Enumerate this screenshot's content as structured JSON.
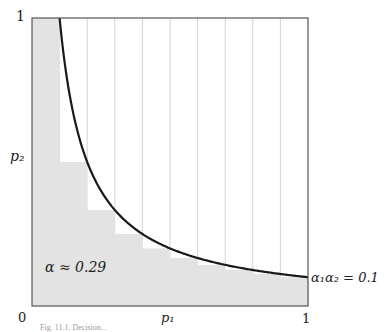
{
  "figure": {
    "annotation_alpha": "α ≈ 0.29",
    "curve_label": "α₁α₂ = 0.1",
    "x_axis_label": "p₁",
    "y_axis_label": "p₂",
    "tick_x0": "0",
    "tick_x1": "1",
    "tick_y1": "1",
    "caption": "Fig. 11.1. Decision..."
  },
  "colors": {
    "shade": "#e3e3e3",
    "frame": "#555555",
    "grid": "#c8c8c8",
    "curve": "#1a1a1a"
  },
  "chart_data": {
    "type": "area",
    "title": "",
    "xlabel": "p1",
    "ylabel": "p2",
    "xlim": [
      0,
      1
    ],
    "ylim": [
      0,
      1
    ],
    "grid": "vertical lines at every 0.1",
    "curve": {
      "equation": "p1 * p2 = 0.1",
      "label": "α1α2 = 0.1"
    },
    "shaded_region": {
      "description": "staircase below curve, plus column p1 in [0,0.1] shaded full height",
      "x_edges": [
        0.0,
        0.1,
        0.2,
        0.3,
        0.4,
        0.5,
        0.6,
        0.7,
        0.8,
        0.9,
        1.0
      ],
      "heights": [
        1.0,
        0.5,
        0.333,
        0.25,
        0.2,
        0.167,
        0.143,
        0.125,
        0.111,
        0.1
      ]
    },
    "annotations": [
      "α ≈ 0.29",
      "α1α2 = 0.1"
    ]
  }
}
